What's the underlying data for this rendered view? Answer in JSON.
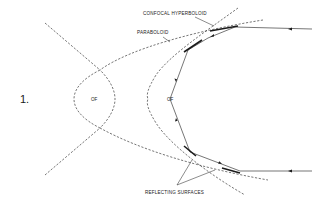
{
  "figure": {
    "number": "1.",
    "labels": {
      "confocal_hyperboloid": "CONFOCAL HYPERBOLOID",
      "paraboloid": "PARABOLOID",
      "reflecting_surfaces": "REFLECTING SURFACES"
    },
    "focus_labels": {
      "left": "OF",
      "right": "OF"
    },
    "colors": {
      "line": "#1a1a1a",
      "background": "#ffffff"
    }
  }
}
